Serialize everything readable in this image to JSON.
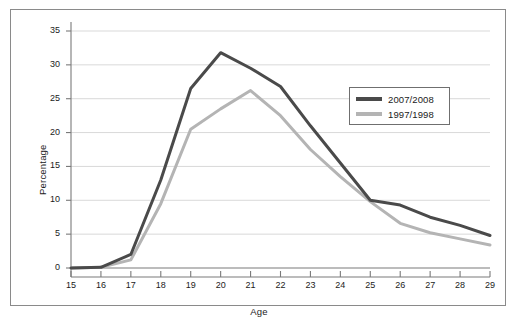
{
  "chart_data": {
    "type": "line",
    "title": "",
    "xlabel": "Age",
    "ylabel": "Percentage",
    "xlim": [
      15,
      29
    ],
    "ylim": [
      0,
      35
    ],
    "ygrid": true,
    "xgrid": false,
    "legend_position": "upper-right-inside",
    "categories": [
      15,
      16,
      17,
      18,
      19,
      20,
      21,
      22,
      23,
      24,
      25,
      26,
      27,
      28,
      29
    ],
    "xticklabels": [
      "15",
      "16",
      "17",
      "18",
      "19",
      "20",
      "21",
      "22",
      "23",
      "24",
      "25",
      "26",
      "27",
      "28",
      "29"
    ],
    "yticks": [
      0,
      5,
      10,
      15,
      20,
      25,
      30,
      35
    ],
    "yticklabels": [
      "0",
      "5",
      "10",
      "15",
      "20",
      "25",
      "30",
      "35"
    ],
    "series": [
      {
        "name": "2007/2008",
        "color": "#4a4a4a",
        "values": [
          0,
          0.1,
          2.0,
          13.0,
          26.5,
          31.8,
          29.5,
          26.8,
          21.0,
          15.5,
          10.0,
          9.3,
          7.5,
          6.3,
          4.8
        ]
      },
      {
        "name": "1997/1998",
        "color": "#b4b4b4",
        "values": [
          0,
          0.1,
          1.2,
          9.5,
          20.5,
          23.5,
          26.2,
          22.5,
          17.5,
          13.5,
          9.8,
          6.6,
          5.2,
          4.3,
          3.4
        ]
      }
    ]
  },
  "axes": {
    "y_title": "Percentage",
    "x_title": "Age"
  },
  "legend": {
    "entries": [
      {
        "label": "2007/2008",
        "color": "#4a4a4a"
      },
      {
        "label": "1997/1998",
        "color": "#b4b4b4"
      }
    ]
  },
  "caption": {
    "text": ""
  },
  "colors": {
    "series_dark": "#4a4a4a",
    "series_light": "#b4b4b4",
    "grid": "#d9d9d9",
    "axis": "#7a7a7a",
    "frame": "#8a8a8a",
    "text": "#1b1b1b"
  }
}
